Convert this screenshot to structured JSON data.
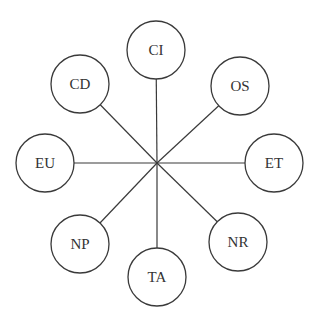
{
  "diagram": {
    "type": "hub-and-spoke",
    "hub": {
      "x": 157,
      "y": 163
    },
    "radius": 29,
    "nodes": [
      {
        "id": "CI",
        "label": "CI",
        "x": 156,
        "y": 50
      },
      {
        "id": "OS",
        "label": "OS",
        "x": 240,
        "y": 86
      },
      {
        "id": "ET",
        "label": "ET",
        "x": 274,
        "y": 163
      },
      {
        "id": "NR",
        "label": "NR",
        "x": 238,
        "y": 242
      },
      {
        "id": "TA",
        "label": "TA",
        "x": 157,
        "y": 277
      },
      {
        "id": "NP",
        "label": "NP",
        "x": 80,
        "y": 244
      },
      {
        "id": "EU",
        "label": "EU",
        "x": 45,
        "y": 163
      },
      {
        "id": "CD",
        "label": "CD",
        "x": 80,
        "y": 84
      }
    ]
  }
}
